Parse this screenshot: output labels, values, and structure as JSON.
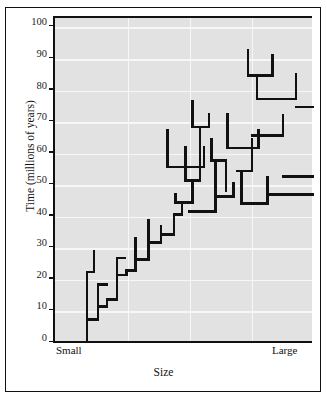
{
  "chart_data": {
    "type": "line",
    "title": "",
    "subtitle": "",
    "xlabel": "Size",
    "ylabel": "Time (millions of years)",
    "xlim": [
      0,
      100
    ],
    "ylim": [
      0,
      103
    ],
    "grid": true,
    "legend": "none",
    "y_ticks": [
      0,
      10,
      20,
      30,
      40,
      50,
      60,
      70,
      80,
      90,
      100
    ],
    "y_tick_labels": [
      "0",
      "10",
      "20",
      "30",
      "40",
      "50",
      "60",
      "70",
      "80",
      "90",
      "100"
    ],
    "x_tick_labels": [
      "Small",
      "Large"
    ],
    "x_gridlines": [
      28,
      52,
      76
    ],
    "colors": {
      "plot_background": "#e2e2e2",
      "gridline": "#f7f7f7",
      "branch": "#111111",
      "axis": "#111111",
      "page_background": "#ffffff"
    },
    "branch_line_width": 2.6,
    "series": [
      {
        "name": "phylogeny-branches",
        "segments": [
          {
            "type": "v",
            "x": 12.4,
            "y0": 0.0,
            "y1": 7.5
          },
          {
            "type": "h",
            "y": 7.5,
            "x0": 12.4,
            "x1": 16.6
          },
          {
            "type": "v",
            "x": 12.4,
            "y0": 7.5,
            "y1": 22.5
          },
          {
            "type": "h",
            "y": 22.5,
            "x0": 12.4,
            "x1": 15.0
          },
          {
            "type": "v",
            "x": 15.0,
            "y0": 22.5,
            "y1": 29.0
          },
          {
            "type": "v",
            "x": 16.6,
            "y0": 7.5,
            "y1": 11.5
          },
          {
            "type": "h",
            "y": 11.5,
            "x0": 16.6,
            "x1": 20.0
          },
          {
            "type": "v",
            "x": 16.6,
            "y0": 11.5,
            "y1": 18.5
          },
          {
            "type": "h",
            "y": 18.5,
            "x0": 16.6,
            "x1": 20.0
          },
          {
            "type": "v",
            "x": 20.0,
            "y0": 11.5,
            "y1": 13.8
          },
          {
            "type": "h",
            "y": 13.8,
            "x0": 20.0,
            "x1": 24.0
          },
          {
            "type": "v",
            "x": 24.0,
            "y0": 13.8,
            "y1": 21.6
          },
          {
            "type": "h",
            "y": 21.6,
            "x0": 24.0,
            "x1": 27.5
          },
          {
            "type": "v",
            "x": 24.0,
            "y0": 21.6,
            "y1": 27.0
          },
          {
            "type": "h",
            "y": 27.0,
            "x0": 24.0,
            "x1": 27.0
          },
          {
            "type": "v",
            "x": 27.5,
            "y0": 21.6,
            "y1": 23.0
          },
          {
            "type": "h",
            "y": 23.0,
            "x0": 27.5,
            "x1": 31.0
          },
          {
            "type": "v",
            "x": 31.0,
            "y0": 23.0,
            "y1": 26.4
          },
          {
            "type": "h",
            "y": 26.4,
            "x0": 31.0,
            "x1": 36.0
          },
          {
            "type": "v",
            "x": 31.0,
            "y0": 26.4,
            "y1": 33.3
          },
          {
            "type": "v",
            "x": 15.0,
            "y0": 29.0,
            "y1": 29.0
          },
          {
            "type": "v",
            "x": 36.0,
            "y0": 26.4,
            "y1": 31.8
          },
          {
            "type": "h",
            "y": 31.8,
            "x0": 36.0,
            "x1": 41.0
          },
          {
            "type": "v",
            "x": 36.0,
            "y0": 31.8,
            "y1": 38.8
          },
          {
            "type": "v",
            "x": 41.0,
            "y0": 31.8,
            "y1": 34.3
          },
          {
            "type": "h",
            "y": 34.3,
            "x0": 41.0,
            "x1": 46.0
          },
          {
            "type": "v",
            "x": 41.0,
            "y0": 34.3,
            "y1": 37.0
          },
          {
            "type": "v",
            "x": 46.0,
            "y0": 34.3,
            "y1": 40.7
          },
          {
            "type": "h",
            "y": 40.7,
            "x0": 46.0,
            "x1": 49.0
          },
          {
            "type": "v",
            "x": 49.0,
            "y0": 40.7,
            "y1": 44.5
          },
          {
            "type": "h",
            "y": 44.5,
            "x0": 46.5,
            "x1": 53.0
          },
          {
            "type": "v",
            "x": 46.5,
            "y0": 44.5,
            "y1": 47.0
          },
          {
            "type": "v",
            "x": 53.0,
            "y0": 44.5,
            "y1": 51.5
          },
          {
            "type": "h",
            "y": 51.5,
            "x0": 50.5,
            "x1": 56.0
          },
          {
            "type": "v",
            "x": 50.5,
            "y0": 51.5,
            "y1": 62.0
          },
          {
            "type": "v",
            "x": 56.0,
            "y0": 51.5,
            "y1": 68.5
          },
          {
            "type": "h",
            "y": 68.5,
            "x0": 53.0,
            "x1": 59.5
          },
          {
            "type": "v",
            "x": 53.0,
            "y0": 68.5,
            "y1": 76.5
          },
          {
            "type": "v",
            "x": 59.5,
            "y0": 68.5,
            "y1": 72.5
          },
          {
            "type": "h",
            "y": 55.8,
            "x0": 43.5,
            "x1": 57.5
          },
          {
            "type": "v",
            "x": 43.5,
            "y0": 55.8,
            "y1": 67.3
          },
          {
            "type": "v",
            "x": 57.5,
            "y0": 55.8,
            "y1": 62.0
          },
          {
            "type": "h",
            "y": 57.8,
            "x0": 60.5,
            "x1": 66.0
          },
          {
            "type": "v",
            "x": 60.5,
            "y0": 57.8,
            "y1": 64.5
          },
          {
            "type": "v",
            "x": 66.0,
            "y0": 57.8,
            "y1": 48.2
          },
          {
            "type": "h",
            "y": 41.6,
            "x0": 52.0,
            "x1": 62.0
          },
          {
            "type": "v",
            "x": 62.0,
            "y0": 41.6,
            "y1": 57.0
          },
          {
            "type": "h",
            "y": 46.5,
            "x0": 62.5,
            "x1": 69.0
          },
          {
            "type": "v",
            "x": 69.0,
            "y0": 46.5,
            "y1": 50.5
          },
          {
            "type": "h",
            "y": 44.2,
            "x0": 72.0,
            "x1": 82.0
          },
          {
            "type": "v",
            "x": 72.0,
            "y0": 44.2,
            "y1": 54.5
          },
          {
            "type": "v",
            "x": 82.0,
            "y0": 44.2,
            "y1": 52.5
          },
          {
            "type": "h",
            "y": 54.5,
            "x0": 70.5,
            "x1": 76.0
          },
          {
            "type": "v",
            "x": 76.0,
            "y0": 54.5,
            "y1": 64.5
          },
          {
            "type": "h",
            "y": 61.8,
            "x0": 66.5,
            "x1": 78.5
          },
          {
            "type": "v",
            "x": 66.5,
            "y0": 61.8,
            "y1": 72.5
          },
          {
            "type": "v",
            "x": 78.5,
            "y0": 61.8,
            "y1": 67.3
          },
          {
            "type": "h",
            "y": 65.8,
            "x0": 76.0,
            "x1": 88.0
          },
          {
            "type": "v",
            "x": 88.0,
            "y0": 65.8,
            "y1": 72.3
          },
          {
            "type": "h",
            "y": 77.3,
            "x0": 78.0,
            "x1": 93.0
          },
          {
            "type": "v",
            "x": 78.0,
            "y0": 77.3,
            "y1": 84.8
          },
          {
            "type": "v",
            "x": 93.0,
            "y0": 77.3,
            "y1": 85.3
          },
          {
            "type": "h",
            "y": 84.8,
            "x0": 74.5,
            "x1": 84.0
          },
          {
            "type": "v",
            "x": 74.5,
            "y0": 84.8,
            "y1": 92.8
          },
          {
            "type": "v",
            "x": 84.0,
            "y0": 84.8,
            "y1": 91.3
          },
          {
            "type": "h",
            "y": 74.8,
            "x0": 93.0,
            "x1": 103.0
          },
          {
            "type": "v",
            "x": 103.0,
            "y0": 74.8,
            "y1": 98.8
          },
          {
            "type": "h",
            "y": 83.0,
            "x0": 103.0,
            "x1": 117.0
          },
          {
            "type": "v",
            "x": 117.0,
            "y0": 83.0,
            "y1": 91.5
          },
          {
            "type": "h",
            "y": 52.8,
            "x0": 88.0,
            "x1": 113.0
          },
          {
            "type": "v",
            "x": 113.0,
            "y0": 52.8,
            "y1": 66.3
          },
          {
            "type": "h",
            "y": 47.0,
            "x0": 82.0,
            "x1": 101.0
          },
          {
            "type": "v",
            "x": 101.0,
            "y0": 47.0,
            "y1": 61.8
          },
          {
            "type": "h",
            "y": 61.5,
            "x0": 113.0,
            "x1": 128.0
          },
          {
            "type": "v",
            "x": 128.0,
            "y0": 61.5,
            "y1": 67.3
          },
          {
            "type": "h",
            "y": 67.3,
            "x0": 128.0,
            "x1": 138.0
          },
          {
            "type": "v",
            "x": 138.0,
            "y0": 67.3,
            "y1": 72.5
          },
          {
            "type": "h",
            "y": 72.5,
            "x0": 132.0,
            "x1": 143.0
          },
          {
            "type": "v",
            "x": 132.0,
            "y0": 72.5,
            "y1": 82.0
          },
          {
            "type": "h",
            "y": 78.8,
            "x0": 138.0,
            "x1": 148.0
          },
          {
            "type": "v",
            "x": 148.0,
            "y0": 78.8,
            "y1": 94.3
          },
          {
            "type": "h",
            "y": 87.3,
            "x0": 140.0,
            "x1": 152.0
          },
          {
            "type": "v",
            "x": 140.0,
            "y0": 87.3,
            "y1": 91.8
          },
          {
            "type": "h",
            "y": 95.0,
            "x0": 143.0,
            "x1": 157.0
          },
          {
            "type": "v",
            "x": 143.0,
            "y0": 95.0,
            "y1": 101.5
          },
          {
            "type": "v",
            "x": 157.0,
            "y0": 95.0,
            "y1": 101.3
          },
          {
            "type": "h",
            "y": 97.5,
            "x0": 152.0,
            "x1": 163.0
          },
          {
            "type": "v",
            "x": 163.0,
            "y0": 97.5,
            "y1": 103.0
          },
          {
            "type": "h",
            "y": 87.8,
            "x0": 155.0,
            "x1": 168.0
          },
          {
            "type": "v",
            "x": 168.0,
            "y0": 87.8,
            "y1": 96.3
          }
        ]
      }
    ]
  },
  "axes": {
    "y_title": "Time (millions of years)",
    "x_title": "Size",
    "x_left_label": "Small",
    "x_right_label": "Large"
  }
}
